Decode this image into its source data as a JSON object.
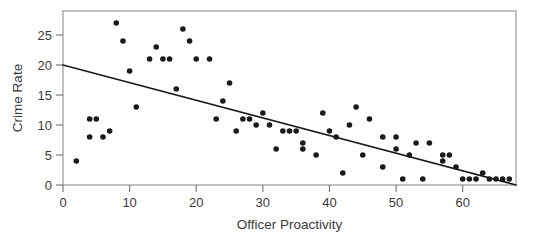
{
  "chart_data": {
    "type": "scatter",
    "title": "",
    "subtitle": "",
    "xlabel": "Officer Proactivity",
    "ylabel": "Crime Rate",
    "xlim": [
      0,
      68
    ],
    "ylim": [
      0,
      29
    ],
    "xticks": [
      0,
      10,
      20,
      30,
      40,
      50,
      60
    ],
    "yticks": [
      0,
      5,
      10,
      15,
      20,
      25
    ],
    "xtick_labels": [
      "0",
      "10",
      "20",
      "30",
      "40",
      "50",
      "60"
    ],
    "ytick_labels": [
      "0",
      "5",
      "10",
      "15",
      "20",
      "25"
    ],
    "grid": false,
    "legend": null,
    "legend_position": "none",
    "point_color": "#1a1a1a",
    "line_color": "#1a1a1a",
    "frame_color": "#8d8d8d",
    "annotations": [],
    "series": [
      {
        "name": "Observations",
        "type": "scatter",
        "points": [
          [
            2,
            4
          ],
          [
            4,
            8
          ],
          [
            4,
            11
          ],
          [
            5,
            11
          ],
          [
            6,
            8
          ],
          [
            7,
            9
          ],
          [
            8,
            27
          ],
          [
            9,
            24
          ],
          [
            10,
            19
          ],
          [
            11,
            13
          ],
          [
            13,
            21
          ],
          [
            14,
            23
          ],
          [
            15,
            21
          ],
          [
            16,
            21
          ],
          [
            17,
            16
          ],
          [
            18,
            26
          ],
          [
            19,
            24
          ],
          [
            20,
            21
          ],
          [
            22,
            21
          ],
          [
            23,
            11
          ],
          [
            24,
            14
          ],
          [
            25,
            17
          ],
          [
            26,
            9
          ],
          [
            27,
            11
          ],
          [
            28,
            11
          ],
          [
            29,
            10
          ],
          [
            30,
            12
          ],
          [
            31,
            10
          ],
          [
            32,
            6
          ],
          [
            33,
            9
          ],
          [
            34,
            9
          ],
          [
            35,
            9
          ],
          [
            36,
            6
          ],
          [
            36,
            7
          ],
          [
            38,
            5
          ],
          [
            39,
            12
          ],
          [
            40,
            9
          ],
          [
            41,
            8
          ],
          [
            42,
            2
          ],
          [
            43,
            10
          ],
          [
            44,
            13
          ],
          [
            45,
            5
          ],
          [
            46,
            11
          ],
          [
            48,
            3
          ],
          [
            48,
            8
          ],
          [
            50,
            6
          ],
          [
            50,
            8
          ],
          [
            51,
            1
          ],
          [
            52,
            5
          ],
          [
            53,
            7
          ],
          [
            54,
            1
          ],
          [
            55,
            7
          ],
          [
            57,
            5
          ],
          [
            57,
            4
          ],
          [
            58,
            5
          ],
          [
            59,
            3
          ],
          [
            60,
            1
          ],
          [
            61,
            1
          ],
          [
            62,
            1
          ],
          [
            63,
            2
          ],
          [
            64,
            1
          ],
          [
            65,
            1
          ],
          [
            66,
            1
          ],
          [
            67,
            1
          ]
        ]
      },
      {
        "name": "Least-squares regression line",
        "type": "line",
        "endpoints": [
          [
            0,
            20
          ],
          [
            68,
            0
          ]
        ],
        "slope": -0.294,
        "intercept": 20
      }
    ]
  },
  "axes": {
    "y_title": "Crime Rate",
    "x_title": "Officer Proactivity"
  }
}
